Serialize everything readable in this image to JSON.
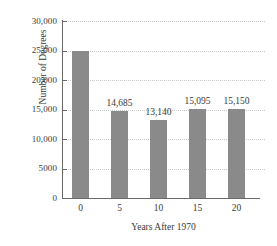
{
  "chart_data": {
    "type": "bar",
    "title": "",
    "xlabel": "Years After 1970",
    "ylabel": "Number of Degrees",
    "categories": [
      "0",
      "5",
      "10",
      "15",
      "20"
    ],
    "values": [
      25000,
      14685,
      13140,
      15095,
      15150
    ],
    "point_labels": [
      "",
      "14,685",
      "13,140",
      "15,095",
      "15,150"
    ],
    "ylim": [
      0,
      30000
    ],
    "xlim": [
      -2.5,
      22.5
    ],
    "ytick_values": [
      0,
      5000,
      10000,
      15000,
      20000,
      25000,
      30000
    ],
    "ytick_labels": [
      "0",
      "5000",
      "10,000",
      "15,000",
      "20,000",
      "25,000",
      "30,000"
    ],
    "xtick_labels": [
      "0",
      "5",
      "10",
      "15",
      "20"
    ],
    "grid": "horizontal-dotted",
    "legend": "none",
    "bar_color": "#8a8a8a",
    "axis_color": "#6a6a6a",
    "gridline_color": "#c8c8c8",
    "background_color": "#ffffff"
  }
}
